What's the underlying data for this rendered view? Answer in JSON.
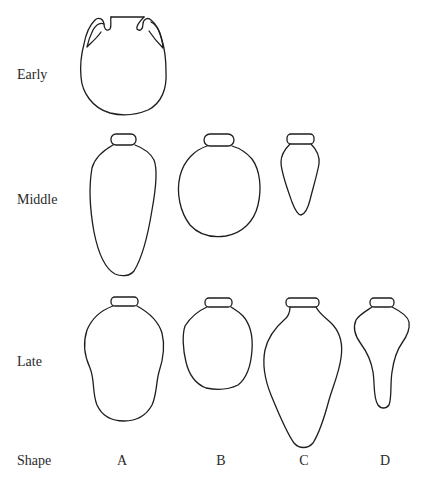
{
  "figure": {
    "rows": [
      {
        "id": "early",
        "label": "Early"
      },
      {
        "id": "middle",
        "label": "Middle"
      },
      {
        "id": "late",
        "label": "Late"
      }
    ],
    "columns_header": "Shape",
    "columns": [
      {
        "id": "A",
        "label": "A"
      },
      {
        "id": "B",
        "label": "B"
      },
      {
        "id": "C",
        "label": "C"
      },
      {
        "id": "D",
        "label": "D"
      }
    ],
    "cells": [
      {
        "row": "Early",
        "shape": "A",
        "description": "Globular two-handled jar with wide neck"
      },
      {
        "row": "Middle",
        "shape": "A",
        "description": "Elongated ovoid jar with rolled rim"
      },
      {
        "row": "Middle",
        "shape": "B",
        "description": "Globular jar with rolled rim"
      },
      {
        "row": "Middle",
        "shape": "C",
        "description": "Small conical jar with rolled rim"
      },
      {
        "row": "Late",
        "shape": "A",
        "description": "Bag-shaped jar with rolled rim"
      },
      {
        "row": "Late",
        "shape": "B",
        "description": "Squat rounded jar with rolled rim"
      },
      {
        "row": "Late",
        "shape": "C",
        "description": "Large piriform jar with rolled rim"
      },
      {
        "row": "Late",
        "shape": "D",
        "description": "Carrot-shaped jar with pronounced shoulders and narrow toe"
      }
    ],
    "stroke_color": "#1e1e1e",
    "text_color": "#2a2a2a",
    "background": "#ffffff"
  }
}
